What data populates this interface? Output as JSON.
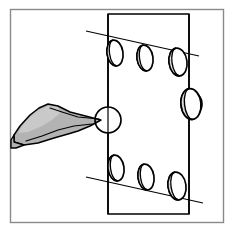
{
  "figure": {
    "title": "Technical line drawing of a notched plate with oval features and a pointing tool",
    "kind": "patent-style-line-art",
    "canvas": {
      "width": 233,
      "height": 232,
      "background": "#ffffff"
    },
    "frame": {
      "label": "drawing border",
      "x": 10,
      "y": 9,
      "width": 214,
      "height": 214,
      "stroke": "#8a8a8a",
      "stroke_width": 1.4,
      "fill": "#ffffff"
    },
    "palette": {
      "ink": "#000000",
      "frame_gray": "#8a8a8a",
      "tool_fill": "#b3b3b3",
      "tool_fill_dark": "#a0a0a0",
      "tool_highlight": "#c9c9c9",
      "oval_shade": "#e4e4e4",
      "paper": "#ffffff"
    },
    "plate": {
      "label": "workpiece plate",
      "stroke": "#000000",
      "stroke_width": 1.6,
      "fill": "#ffffff",
      "left_x": 108,
      "right_x": 189,
      "top_y": 14,
      "bottom_y": 214,
      "notch_radius": 13,
      "left_notch_center_y": 120,
      "right_notch_center_y": 104
    },
    "guide_lines": [
      {
        "name": "upper-slope-line",
        "x1": 88,
        "y1": 32,
        "x2": 197,
        "y2": 56,
        "stroke": "#000000",
        "stroke_width": 1.1
      },
      {
        "name": "lower-slope-line",
        "x1": 88,
        "y1": 178,
        "x2": 201,
        "y2": 202,
        "stroke": "#000000",
        "stroke_width": 1.1
      },
      {
        "name": "plate-left-edge-extension",
        "x1": 108,
        "y1": 14,
        "x2": 108,
        "y2": 214,
        "stroke": "#000000",
        "stroke_width": 1.2
      },
      {
        "name": "plate-right-edge-extension",
        "x1": 189,
        "y1": 14,
        "x2": 189,
        "y2": 214,
        "stroke": "#000000",
        "stroke_width": 1.2
      }
    ],
    "ovals": [
      {
        "name": "oval-top-left",
        "cx": 115,
        "cy": 53,
        "rx": 8,
        "ry": 13,
        "rotate": -8,
        "row": "top",
        "index": 1
      },
      {
        "name": "oval-top-center",
        "cx": 145,
        "cy": 58,
        "rx": 8,
        "ry": 13,
        "rotate": -8,
        "row": "top",
        "index": 2
      },
      {
        "name": "oval-top-right",
        "cx": 178,
        "cy": 62,
        "rx": 9,
        "ry": 14,
        "rotate": -8,
        "row": "top",
        "index": 3
      },
      {
        "name": "oval-right-notch",
        "cx": 192,
        "cy": 104,
        "rx": 10,
        "ry": 15,
        "rotate": -6,
        "row": "right",
        "index": 4
      },
      {
        "name": "oval-bottom-left",
        "cx": 116,
        "cy": 168,
        "rx": 8,
        "ry": 13,
        "rotate": -8,
        "row": "bottom",
        "index": 5
      },
      {
        "name": "oval-bottom-center",
        "cx": 146,
        "cy": 177,
        "rx": 8,
        "ry": 13,
        "rotate": -8,
        "row": "bottom",
        "index": 6
      },
      {
        "name": "oval-bottom-right",
        "cx": 177,
        "cy": 186,
        "rx": 9,
        "ry": 14,
        "rotate": -8,
        "row": "bottom",
        "index": 7
      }
    ],
    "oval_style": {
      "outline_stroke": "#000000",
      "outline_width": 1.6,
      "inner_stroke_width": 1.3,
      "shaded_fill": "#e6e6e6",
      "bright_fill": "#ffffff",
      "stipple_color": "#6f6f6f",
      "stipple_dot_radius": 0.55
    },
    "tool": {
      "name": "pointed chisel tool",
      "fill": "#b3b3b3",
      "stroke": "#000000",
      "stroke_width": 1.5,
      "tip_x": 101,
      "tip_y": 120,
      "handle_start_x": 14,
      "handle_start_y": 144,
      "points": "101,120 72,110 55,106 46,110 38,117 22,129 14,137 16,144 30,144 46,141 62,136 74,133 80,131 89,127",
      "highlight_points": "58,110 46,114 36,121 24,130 20,136 30,134 44,128 56,122",
      "shaft_points": "14,137 16,144 30,144 46,141 62,136 74,133 80,131"
    }
  }
}
